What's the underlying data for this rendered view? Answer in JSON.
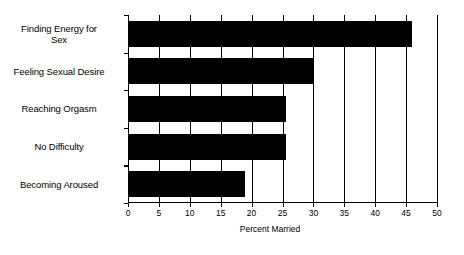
{
  "chart_data": {
    "type": "bar",
    "orientation": "horizontal",
    "title": "",
    "subtitle": "",
    "xlabel": "Percent Married",
    "ylabel": "",
    "xlim": [
      0,
      50
    ],
    "xticks": [
      0,
      5,
      10,
      15,
      20,
      25,
      30,
      35,
      40,
      45,
      50
    ],
    "xtick_labels": [
      "0",
      "5",
      "10",
      "15",
      "20",
      "25",
      "30",
      "35",
      "40",
      "45",
      "50"
    ],
    "grid": true,
    "grid_axis": "x",
    "legend": false,
    "legend_position": "none",
    "bar_color": "#000000",
    "categories": [
      "Finding Energy for\nSex",
      "Feeling Sexual Desire",
      "Reaching Orgasm",
      "No Difficulty",
      "Becoming Aroused"
    ],
    "values": [
      46,
      30,
      25.5,
      25.5,
      19
    ],
    "series": [
      {
        "name": "Percent Married",
        "values": [
          46,
          30,
          25.5,
          25.5,
          19
        ]
      }
    ],
    "annotations": []
  },
  "axis": {
    "x_title": "Percent Married"
  }
}
